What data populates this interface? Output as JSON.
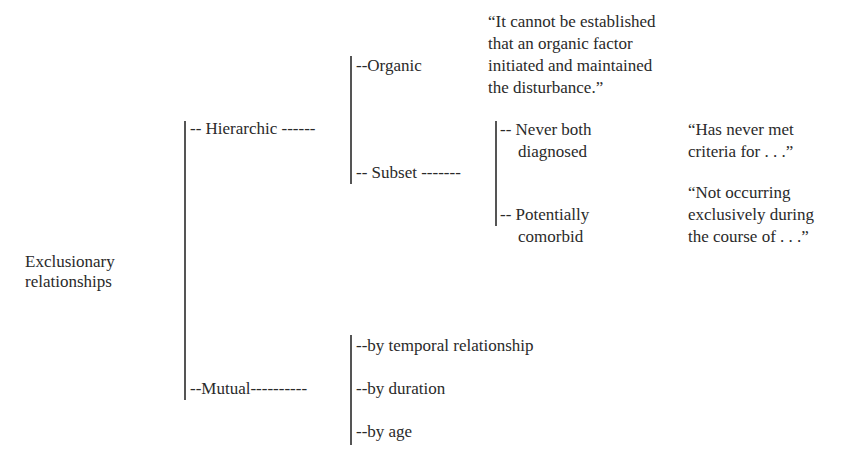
{
  "root": {
    "line1": "Exclusionary",
    "line2": "relationships"
  },
  "branches": {
    "hierarchic": {
      "label": "-- Hierarchic ------",
      "children": {
        "organic": {
          "label": "--Organic",
          "quote": [
            "“It cannot be established",
            "that an organic factor",
            "initiated and maintained",
            "the disturbance.”"
          ]
        },
        "subset": {
          "label": "-- Subset -------",
          "children": {
            "never_both": {
              "label1": "-- Never both",
              "label2": "diagnosed",
              "quote": [
                "“Has never met",
                "criteria for . . .”"
              ]
            },
            "potentially": {
              "label1": "-- Potentially",
              "label2": "comorbid",
              "quote": [
                "“Not occurring",
                "exclusively during",
                "the course of . . .”"
              ]
            }
          }
        }
      }
    },
    "mutual": {
      "label": "--Mutual----------",
      "children": [
        "--by temporal relationship",
        "--by duration",
        "--by age"
      ]
    }
  }
}
